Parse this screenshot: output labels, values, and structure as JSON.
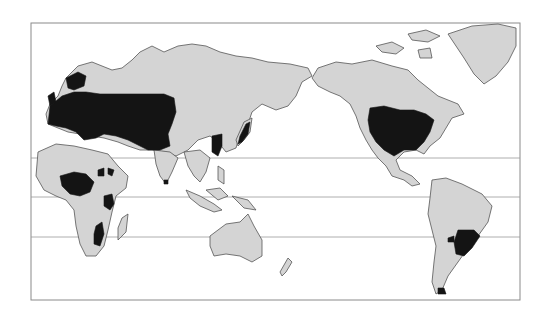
{
  "map": {
    "projection": "pacific-centered-world",
    "colors": {
      "background": "#ffffff",
      "land": "#d4d4d4",
      "highlighted": "#141414",
      "border": "#555555",
      "latitude_lines": "#9a9a9a",
      "frame": "#8a8a8a"
    },
    "highlighted_regions": [
      "Europe and western Russia",
      "Central Asia",
      "Eastern China",
      "Japan",
      "Korea",
      "United States",
      "West/Central Africa",
      "East Africa (Great Lakes)",
      "Southern Africa (Zimbabwe/Mozambique)",
      "Southern Brazil / Uruguay / NE Argentina",
      "Paraguay area",
      "Southern Chile"
    ],
    "latitude_lines_y": [
      158,
      197,
      237
    ]
  }
}
